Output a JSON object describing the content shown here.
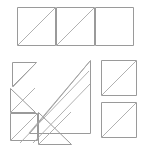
{
  "figure": {
    "title": "Geometric line figure of squares and nested right triangles",
    "background_color": "#ffffff",
    "stroke_color": "#9a9a9a",
    "diagonal_color": "#a8a8a8",
    "width": 148,
    "height": 150,
    "groups": [
      {
        "id": "top-row",
        "label": "Top row of three squares",
        "shapes": [
          {
            "id": "top-square-1",
            "type": "square",
            "x": 17,
            "y": 7,
            "size": 39,
            "diagonal": "bottom-left-to-top-right"
          },
          {
            "id": "top-square-2",
            "type": "square",
            "x": 56,
            "y": 7,
            "size": 39,
            "diagonal": "bottom-left-to-top-right"
          },
          {
            "id": "top-square-3",
            "type": "square",
            "x": 95,
            "y": 7,
            "size": 39,
            "diagonal": "none"
          }
        ]
      },
      {
        "id": "nested-triangles",
        "label": "Nested right triangles at lower left",
        "shapes": [
          {
            "id": "triangle-large",
            "type": "right-triangle",
            "x": 29,
            "y": 60,
            "legs": 73,
            "right_angle": "bottom-left",
            "hypotenuse": "bottom-left-to-top-right"
          },
          {
            "id": "triangle-medium",
            "type": "right-triangle",
            "x": 12,
            "y": 62,
            "legs": 24,
            "right_angle": "bottom-left",
            "hypotenuse": "bottom-left-to-top-right"
          },
          {
            "id": "triangle-small",
            "type": "right-triangle",
            "x": 10,
            "y": 88,
            "legs": 25,
            "right_angle": "bottom-left",
            "hypotenuse": "bottom-left-to-top-right"
          },
          {
            "id": "triangle-inner",
            "type": "right-triangle",
            "x": 38,
            "y": 112,
            "legs": 33,
            "right_angle": "bottom-left",
            "hypotenuse": "bottom-left-to-top-right"
          },
          {
            "id": "square-small-lower-left",
            "type": "square",
            "x": 10,
            "y": 113,
            "size": 28,
            "diagonal": "bottom-left-to-top-right"
          }
        ]
      },
      {
        "id": "right-column",
        "label": "Right column of two squares",
        "shapes": [
          {
            "id": "right-square-1",
            "type": "square",
            "x": 101,
            "y": 60,
            "size": 36,
            "diagonal": "bottom-left-to-top-right"
          },
          {
            "id": "right-square-2",
            "type": "square",
            "x": 101,
            "y": 102,
            "size": 36,
            "diagonal": "bottom-left-to-top-right"
          }
        ]
      }
    ]
  }
}
